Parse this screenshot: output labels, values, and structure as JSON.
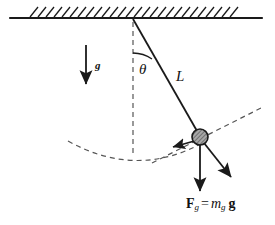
{
  "figure": {
    "background_color": "#ffffff",
    "stroke_color": "#1a1a1a",
    "dashed_color": "#555555",
    "bob_fill_color": "#9a9a9a",
    "width": 275,
    "height": 225
  },
  "labels": {
    "angle": "θ",
    "length": "L",
    "gravity_field": "g",
    "weight_F": "F",
    "weight_F_sub": "g",
    "weight_equals": "=",
    "weight_m": "m",
    "weight_m_sub": "g",
    "weight_g": "g"
  },
  "geometry": {
    "ceiling": {
      "x1": 10,
      "y1": 18,
      "x2": 262,
      "y2": 18
    },
    "hatch": {
      "start_x": 30,
      "end_x": 234,
      "count": 26,
      "slant": 8,
      "height": 10
    },
    "pivot": {
      "x": 133,
      "y": 19
    },
    "bob": {
      "x": 200,
      "y": 137,
      "radius": 8
    },
    "string": {
      "x1": 133,
      "y1": 19,
      "x2": 200,
      "y2": 137
    },
    "vertical_dashed": {
      "x1": 133,
      "y1": 22,
      "x2": 133,
      "y2": 155
    },
    "angle_arc": {
      "cx": 133,
      "cy": 19,
      "r": 34,
      "from_deg": 270,
      "to_deg": 300
    },
    "gravity_arrow": {
      "x1": 86,
      "y1": 45,
      "x2": 86,
      "y2": 85
    },
    "weight_arrow": {
      "x1": 200,
      "y1": 145,
      "x2": 200,
      "y2": 192
    },
    "tangential_arrow": {
      "x1": 197,
      "y1": 141,
      "x2": 172,
      "y2": 148
    },
    "radial_arrow": {
      "x1": 205,
      "y1": 143,
      "x2": 233,
      "y2": 179
    },
    "swing_arc": {
      "start_x": 68,
      "start_y": 141,
      "ctrl_x": 138,
      "ctrl_y": 176,
      "end_x": 205,
      "end_y": 142
    },
    "tangent_line": {
      "x1": 152,
      "y1": 163,
      "x2": 263,
      "y2": 107
    }
  }
}
